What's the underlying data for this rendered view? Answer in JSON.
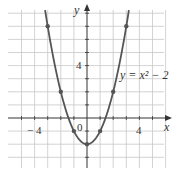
{
  "chart_data": {
    "type": "line",
    "title": "",
    "equation_label": "y = x² − 2",
    "xlabel": "x",
    "ylabel": "y",
    "x_tick_labels": [
      {
        "value": -4,
        "label": "− 4"
      },
      {
        "value": 4,
        "label": "4"
      }
    ],
    "y_tick_labels": [
      {
        "value": 4,
        "label": "4"
      }
    ],
    "origin_label": "0",
    "xlim": [
      -5,
      6
    ],
    "ylim": [
      -3,
      8
    ],
    "grid": true,
    "series": [
      {
        "name": "y = x^2 - 2",
        "function": "x^2 - 2",
        "points": [
          {
            "x": -3,
            "y": 7
          },
          {
            "x": -2,
            "y": 2
          },
          {
            "x": -1,
            "y": -1
          },
          {
            "x": 0,
            "y": -2
          },
          {
            "x": 1,
            "y": -1
          },
          {
            "x": 2,
            "y": 2
          },
          {
            "x": 3,
            "y": 7
          }
        ]
      }
    ],
    "colors": {
      "curve": "#555555",
      "grid": "#c8c8c8",
      "axis": "#333333"
    }
  }
}
